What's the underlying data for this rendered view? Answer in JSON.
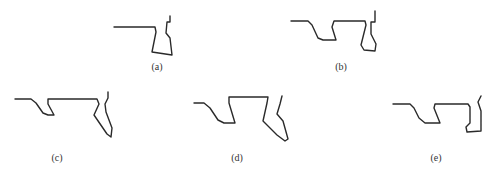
{
  "figure": {
    "line_color": "#2a2a2a",
    "panels": [
      {
        "id": "a",
        "label": "(a)",
        "label_pos": [
          157,
          62
        ],
        "points": [
          [
            114,
            27
          ],
          [
            155,
            27
          ],
          [
            156,
            32
          ],
          [
            152,
            52
          ],
          [
            172,
            55
          ],
          [
            170,
            38
          ],
          [
            166,
            33
          ],
          [
            167,
            22
          ],
          [
            170,
            22
          ],
          [
            170,
            16
          ]
        ]
      },
      {
        "id": "b",
        "label": "(b)",
        "label_pos": [
          341,
          62
        ],
        "points": [
          [
            291,
            21
          ],
          [
            308,
            21
          ],
          [
            312,
            25
          ],
          [
            318,
            38
          ],
          [
            323,
            40
          ],
          [
            336,
            40
          ],
          [
            332,
            27
          ],
          [
            334,
            21
          ],
          [
            365,
            21
          ],
          [
            366,
            25
          ],
          [
            361,
            45
          ],
          [
            364,
            50
          ],
          [
            375,
            51
          ],
          [
            376,
            44
          ],
          [
            371,
            34
          ],
          [
            371,
            22
          ],
          [
            375,
            22
          ],
          [
            375,
            11
          ]
        ]
      },
      {
        "id": "c",
        "label": "(c)",
        "label_pos": [
          57,
          153
        ],
        "points": [
          [
            15,
            99
          ],
          [
            31,
            99
          ],
          [
            36,
            103
          ],
          [
            43,
            113
          ],
          [
            48,
            115
          ],
          [
            54,
            115
          ],
          [
            48,
            104
          ],
          [
            48,
            99
          ],
          [
            97,
            99
          ],
          [
            99,
            104
          ],
          [
            94,
            115
          ],
          [
            107,
            134
          ],
          [
            111,
            137
          ],
          [
            112,
            128
          ],
          [
            106,
            112
          ],
          [
            105,
            104
          ],
          [
            108,
            98
          ],
          [
            108,
            92
          ]
        ]
      },
      {
        "id": "d",
        "label": "(d)",
        "label_pos": [
          237,
          153
        ],
        "points": [
          [
            194,
            103
          ],
          [
            204,
            103
          ],
          [
            210,
            108
          ],
          [
            218,
            120
          ],
          [
            224,
            123
          ],
          [
            235,
            123
          ],
          [
            229,
            103
          ],
          [
            229,
            97
          ],
          [
            268,
            97
          ],
          [
            267,
            103
          ],
          [
            263,
            121
          ],
          [
            277,
            135
          ],
          [
            285,
            141
          ],
          [
            288,
            139
          ],
          [
            283,
            121
          ],
          [
            277,
            114
          ],
          [
            280,
            104
          ],
          [
            282,
            96
          ]
        ]
      },
      {
        "id": "e",
        "label": "(e)",
        "label_pos": [
          436,
          153
        ],
        "points": [
          [
            393,
            104
          ],
          [
            410,
            104
          ],
          [
            414,
            108
          ],
          [
            419,
            118
          ],
          [
            425,
            123
          ],
          [
            440,
            123
          ],
          [
            434,
            108
          ],
          [
            435,
            104
          ],
          [
            468,
            104
          ],
          [
            470,
            107
          ],
          [
            470,
            123
          ],
          [
            466,
            127
          ],
          [
            467,
            132
          ],
          [
            481,
            131
          ],
          [
            481,
            111
          ],
          [
            478,
            102
          ],
          [
            481,
            96
          ]
        ]
      }
    ]
  }
}
